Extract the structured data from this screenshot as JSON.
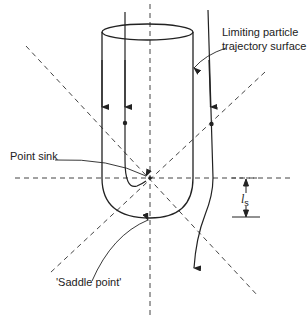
{
  "diagram": {
    "labels": {
      "limiting_surface_line1": "Limiting particle",
      "limiting_surface_line2": "trajectory surface",
      "point_sink": "Point sink",
      "saddle_point": "'Saddle point'",
      "ls_symbol": "l",
      "ls_subscript": "s"
    },
    "colors": {
      "stroke": "#222222",
      "dashed": "#444444",
      "background": "#ffffff"
    },
    "icons": [
      "arrowhead-icon",
      "dot-marker-icon"
    ]
  }
}
